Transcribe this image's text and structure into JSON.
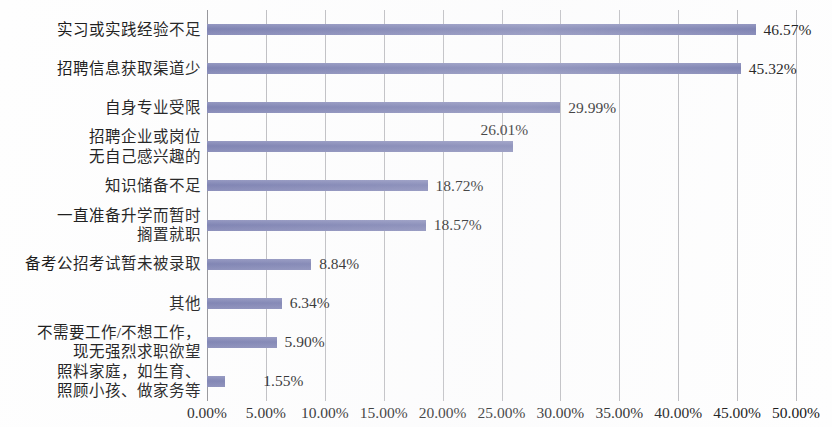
{
  "chart_data": {
    "type": "bar",
    "orientation": "horizontal",
    "title": "",
    "subtitle": "",
    "xlabel": "",
    "ylabel": "",
    "xlim": [
      0,
      50
    ],
    "xtick_step": 5,
    "grid": true,
    "legend": "none",
    "value_suffix": "%",
    "bar_color": "#7b7fb0",
    "gridline_color": "#b9b9bd",
    "axis_color": "#8d8d92",
    "text_color": "#131313",
    "categories": [
      "实习或实践经验不足",
      "招聘信息获取渠道少",
      "自身专业受限",
      "招聘企业或岗位\n无自己感兴趣的",
      "知识储备不足",
      "一直准备升学而暂时\n搁置就职",
      "备考公招考试暂未被录取",
      "其他",
      "不需要工作/不想工作，\n现无强烈求职欲望",
      "照料家庭，如生育、\n照顾小孩、做家务等"
    ],
    "category_lines": [
      [
        "实习或实践经验不足"
      ],
      [
        "招聘信息获取渠道少"
      ],
      [
        "自身专业受限"
      ],
      [
        "招聘企业或岗位",
        "无自己感兴趣的"
      ],
      [
        "知识储备不足"
      ],
      [
        "一直准备升学而暂时",
        "搁置就职"
      ],
      [
        "备考公招考试暂未被录取"
      ],
      [
        "其他"
      ],
      [
        "不需要工作/不想工作，",
        "现无强烈求职欲望"
      ],
      [
        "照料家庭，如生育、",
        "照顾小孩、做家务等"
      ]
    ],
    "values": [
      46.57,
      45.32,
      29.99,
      26.01,
      18.72,
      18.57,
      8.84,
      6.34,
      5.9,
      1.55
    ],
    "value_labels": [
      "46.57%",
      "45.32%",
      "29.99%",
      "26.01%",
      "18.72%",
      "18.57%",
      "8.84%",
      "6.34%",
      "5.90%",
      "1.55%"
    ],
    "xtick_labels": [
      "0.00%",
      "5.00%",
      "10.00%",
      "15.00%",
      "20.00%",
      "25.00%",
      "30.00%",
      "35.00%",
      "40.00%",
      "45.00%",
      "50.00%"
    ],
    "xtick_values": [
      0,
      5,
      10,
      15,
      20,
      25,
      30,
      35,
      40,
      45,
      50
    ]
  }
}
